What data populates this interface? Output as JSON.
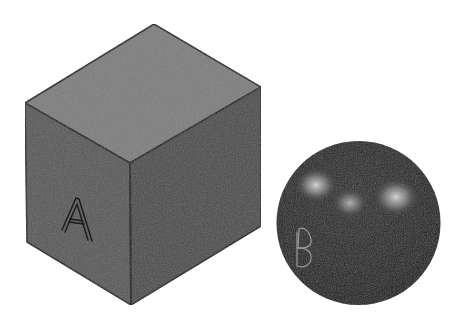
{
  "scene": {
    "background": "#ffffff",
    "objects": [
      {
        "name": "cube",
        "label": "A",
        "shape": "isometric-cube",
        "vertices": {
          "top": [
            154,
            24
          ],
          "left": [
            25,
            103
          ],
          "right": [
            261,
            87
          ],
          "center": [
            130,
            163
          ],
          "bottom_left": [
            27,
            242
          ],
          "bottom_right": [
            261,
            226
          ],
          "bottom": [
            131,
            305
          ]
        },
        "colors": {
          "top_face": "#7e7e7e",
          "left_face": "#585858",
          "right_face": "#4c4c4c",
          "edge": "#1c1c1c"
        }
      },
      {
        "name": "sphere",
        "label": "B",
        "shape": "sphere",
        "center": [
          358.5,
          223
        ],
        "radius": 82,
        "colors": {
          "body": "#1e1e1e",
          "highlight": "#d8d8d8",
          "label_stroke": "#9a9a9a"
        },
        "highlights": [
          {
            "cx": 316,
            "cy": 185,
            "r": 20
          },
          {
            "cx": 350,
            "cy": 202,
            "r": 17
          },
          {
            "cx": 396,
            "cy": 197,
            "r": 22
          }
        ]
      }
    ]
  }
}
